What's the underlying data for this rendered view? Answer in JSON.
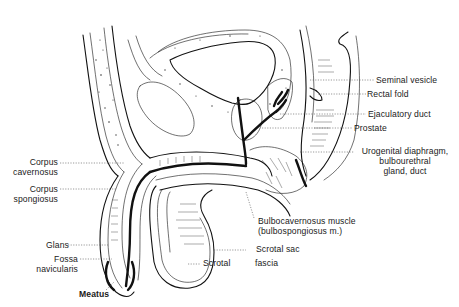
{
  "figure": {
    "labels": {
      "seminal_vesicle": "Seminal vesicle",
      "rectal_fold": "Rectal fold",
      "ejaculatory_duct": "Ejaculatory duct",
      "prostate": "Prostate",
      "urogenital_diaphragm_1": "Urogenital diaphragm,",
      "urogenital_diaphragm_2": "bulbourethral",
      "urogenital_diaphragm_3": "gland, duct",
      "corpus_cavernosum_1": "Corpus",
      "corpus_cavernosum_2": "cavernosus",
      "corpus_spongiosum_1": "Corpus",
      "corpus_spongiosum_2": "spongiosus",
      "bulbocavernosus_1": "Bulbocavernosus muscle",
      "bulbocavernosus_2": "(bulbospongiosus m.)",
      "scrotal_sac": "Scrotal sac",
      "scrotal": "Scrotal",
      "fascia": "fascia",
      "glans": "Glans",
      "fossa_1": "Fossa",
      "fossa_2": "navicularis",
      "meatus": "Meatus"
    }
  }
}
